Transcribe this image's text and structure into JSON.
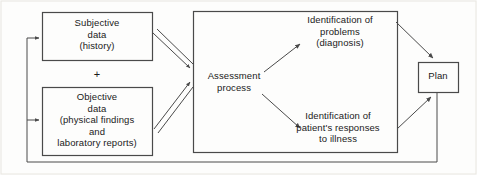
{
  "diagram": {
    "stroke_color": "#4a4a4a",
    "text_color": "#1a1a1a",
    "background_color": "#fdfdfc",
    "nodes": {
      "subjective": {
        "label": "Subjective\ndata\n(history)",
        "name": "subjective-data-box"
      },
      "plus": {
        "label": "+",
        "name": "plus-operator"
      },
      "objective": {
        "label": "Objective\ndata\n(physical findings\nand\nlaboratory reports)",
        "name": "objective-data-box"
      },
      "assessment": {
        "label": "Assessment\nprocess",
        "name": "assessment-process-label"
      },
      "problems": {
        "label": "Identification of\nproblems\n(diagnosis)",
        "name": "identification-of-problems-label"
      },
      "responses": {
        "label": "Identification of\npatient's responses\nto illness",
        "name": "identification-of-responses-label"
      },
      "plan": {
        "label": "Plan",
        "name": "plan-box"
      }
    },
    "connectors": [
      {
        "name": "subjective-to-assessment-arrow",
        "style": "double-line"
      },
      {
        "name": "objective-to-assessment-arrow",
        "style": "double-line"
      },
      {
        "name": "assessment-to-problems-arrow",
        "style": "single-line"
      },
      {
        "name": "assessment-to-responses-arrow",
        "style": "single-line"
      },
      {
        "name": "problems-to-plan-arrow",
        "style": "single-line"
      },
      {
        "name": "responses-to-plan-arrow",
        "style": "single-line"
      },
      {
        "name": "plan-feedback-to-subjective-arrow",
        "style": "single-line"
      },
      {
        "name": "plan-feedback-to-objective-arrow",
        "style": "single-line"
      }
    ]
  }
}
